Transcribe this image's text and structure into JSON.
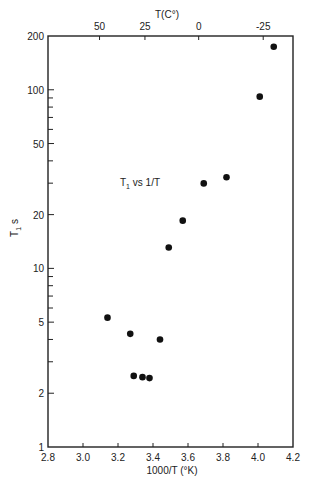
{
  "chart_data": {
    "type": "scatter",
    "title": "",
    "annotation": {
      "main": "T",
      "sub": "1",
      "rest": " vs 1/T"
    },
    "xlabel": "1000/T (°K)",
    "ylabel": {
      "main": "T",
      "sub": "1",
      "rest": " s"
    },
    "top_axis_label": "T(C°)",
    "xlim": [
      2.8,
      4.2
    ],
    "ylim": [
      1,
      200
    ],
    "yscale": "log",
    "grid": false,
    "x_ticks": [
      2.8,
      3.0,
      3.2,
      3.4,
      3.6,
      3.8,
      4.0,
      4.2
    ],
    "x_tick_labels": [
      "2.8",
      "3.0",
      "3.2",
      "3.4",
      "3.6",
      "3.8",
      "4.0",
      "4.2"
    ],
    "y_ticks": [
      1,
      2,
      5,
      10,
      20,
      50,
      100,
      200
    ],
    "y_tick_labels": [
      "1",
      "2",
      "5",
      "10",
      "20",
      "50",
      "100",
      "200"
    ],
    "y_minor_ticks": [
      3,
      4,
      6,
      7,
      8,
      9,
      30,
      40,
      60,
      70,
      80,
      90
    ],
    "top_ticks_celsius": [
      50,
      25,
      0,
      -25
    ],
    "top_tick_labels": [
      "50",
      "25",
      "0",
      "-25"
    ],
    "series": [
      {
        "name": "T1",
        "points": [
          {
            "x": 3.14,
            "y": 5.3
          },
          {
            "x": 3.27,
            "y": 4.3
          },
          {
            "x": 3.29,
            "y": 2.5
          },
          {
            "x": 3.34,
            "y": 2.46
          },
          {
            "x": 3.38,
            "y": 2.43
          },
          {
            "x": 3.44,
            "y": 4.0
          },
          {
            "x": 3.49,
            "y": 13.1
          },
          {
            "x": 3.57,
            "y": 18.5
          },
          {
            "x": 3.69,
            "y": 29.9
          },
          {
            "x": 3.82,
            "y": 32.4
          },
          {
            "x": 4.01,
            "y": 91.5
          },
          {
            "x": 4.09,
            "y": 174
          }
        ]
      }
    ]
  }
}
